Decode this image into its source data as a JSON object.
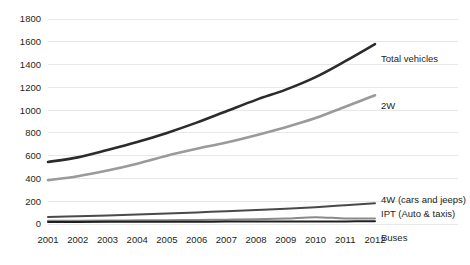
{
  "chart_data": {
    "type": "line",
    "title": "",
    "subtitle": "",
    "xlabel": "",
    "ylabel": "",
    "grid": true,
    "legend_position": "right-inline-labels",
    "categories": [
      "2001",
      "2002",
      "2003",
      "2004",
      "2005",
      "2006",
      "2007",
      "2008",
      "2009",
      "2010",
      "2011",
      "2012"
    ],
    "x": [
      2001,
      2002,
      2003,
      2004,
      2005,
      2006,
      2007,
      2008,
      2009,
      2010,
      2011,
      2012
    ],
    "ylim": [
      0,
      1800
    ],
    "yticks": [
      0,
      200,
      400,
      600,
      800,
      1000,
      1200,
      1400,
      1600,
      1800
    ],
    "series": [
      {
        "name": "Total vehicles",
        "label": "Total vehicles",
        "color": "#2b2b2b",
        "width": 2.6,
        "values": [
          545,
          585,
          650,
          720,
          800,
          890,
          990,
          1090,
          1180,
          1290,
          1430,
          1580
        ]
      },
      {
        "name": "2W",
        "label": "2W",
        "color": "#9a9a9a",
        "width": 2.6,
        "values": [
          385,
          420,
          470,
          530,
          600,
          660,
          715,
          780,
          850,
          930,
          1030,
          1130
        ]
      },
      {
        "name": "4W (cars and jeeps)",
        "label": "4W (cars and jeeps)",
        "color": "#4a4a4a",
        "width": 2.0,
        "values": [
          62,
          68,
          75,
          84,
          93,
          102,
          112,
          122,
          133,
          148,
          165,
          182
        ]
      },
      {
        "name": "IPT (Auto & taxis)",
        "label": "IPT (Auto & taxis)",
        "color": "#8a8a8a",
        "width": 2.0,
        "values": [
          28,
          29,
          30,
          32,
          34,
          36,
          38,
          41,
          48,
          60,
          48,
          48
        ]
      },
      {
        "name": "Buses",
        "label": "Buses",
        "color": "#1f1f1f",
        "width": 2.0,
        "values": [
          18,
          18,
          19,
          19,
          20,
          20,
          21,
          21,
          22,
          22,
          23,
          24
        ]
      }
    ]
  },
  "colors": {
    "background": "#ffffff",
    "gridline": "#e8e8e8",
    "text": "#231f20"
  }
}
